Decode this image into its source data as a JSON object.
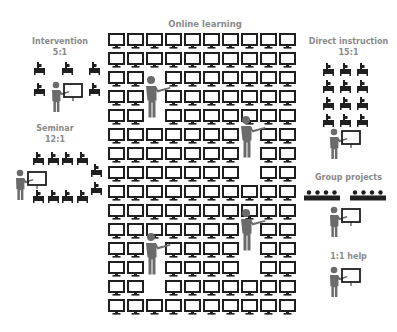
{
  "labels": {
    "online": "Online learning",
    "intervention": "Intervention",
    "intervention_ratio": "5:1",
    "seminar": "Seminar",
    "seminar_ratio": "12:1",
    "direct": "Direct instruction",
    "direct_ratio": "15:1",
    "group": "Group projects",
    "one_on_one": "1:1 help"
  },
  "grid": {
    "columns": 10,
    "rows": 15,
    "blank_cells": [
      [
        2,
        2
      ],
      [
        2,
        3
      ],
      [
        2,
        4
      ],
      [
        7,
        5
      ],
      [
        7,
        6
      ],
      [
        7,
        7
      ],
      [
        7,
        10
      ],
      [
        7,
        11
      ],
      [
        7,
        12
      ],
      [
        2,
        11
      ],
      [
        2,
        12
      ],
      [
        2,
        13
      ]
    ]
  },
  "colors": {
    "icon": "#1f1f1f",
    "teacher": "#6b6b6b",
    "label": "#8a8a8a"
  }
}
